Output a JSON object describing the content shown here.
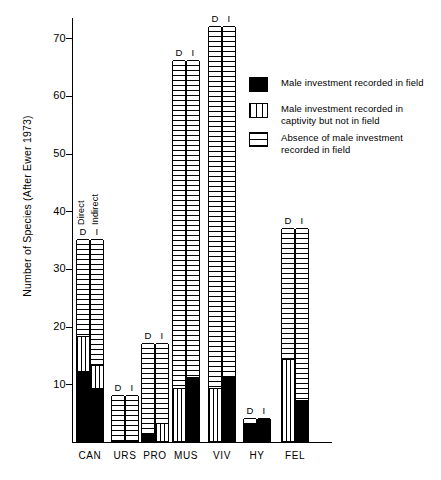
{
  "chart_data": {
    "type": "bar",
    "title": "",
    "xlabel": "",
    "ylabel": "Number of Species (After Ewer 1973)",
    "ylim": [
      0,
      73
    ],
    "grid": false,
    "legend_position": "upper right",
    "ytick_labels": [
      "70",
      "60",
      "50",
      "40",
      "30",
      "20",
      "10"
    ],
    "ytick_values": [
      70,
      60,
      50,
      40,
      30,
      20,
      10
    ],
    "categories": [
      "CAN",
      "URS",
      "PRO",
      "MUS",
      "VIV",
      "HY",
      "FEL"
    ],
    "subgroup_labels": [
      "D",
      "I"
    ],
    "subgroup_names": [
      "Direct",
      "Indirect"
    ],
    "stack_series": [
      {
        "name": "Male investment recorded in field",
        "pattern": "solid-black"
      },
      {
        "name": "Male investment recorded in captivity but not in field",
        "pattern": "vertical-stripes"
      },
      {
        "name": "Absence of male investment recorded in field",
        "pattern": "horizontal-stripes"
      }
    ],
    "bars": [
      {
        "category": "CAN",
        "sub": "D",
        "total": 35,
        "segments": [
          {
            "series": "Male investment recorded in field",
            "from": 0,
            "to": 12
          },
          {
            "series": "Male investment recorded in captivity but not in field",
            "from": 12,
            "to": 18
          },
          {
            "series": "Absence of male investment recorded in field",
            "from": 18,
            "to": 35
          }
        ]
      },
      {
        "category": "CAN",
        "sub": "I",
        "total": 35,
        "segments": [
          {
            "series": "Male investment recorded in field",
            "from": 0,
            "to": 9
          },
          {
            "series": "Male investment recorded in captivity but not in field",
            "from": 9,
            "to": 13
          },
          {
            "series": "Absence of male investment recorded in field",
            "from": 13,
            "to": 35
          }
        ]
      },
      {
        "category": "URS",
        "sub": "D",
        "total": 8,
        "segments": [
          {
            "series": "Absence of male investment recorded in field",
            "from": 0,
            "to": 8
          }
        ]
      },
      {
        "category": "URS",
        "sub": "I",
        "total": 8,
        "segments": [
          {
            "series": "Absence of male investment recorded in field",
            "from": 0,
            "to": 8
          }
        ]
      },
      {
        "category": "PRO",
        "sub": "D",
        "total": 17,
        "segments": [
          {
            "series": "Male investment recorded in field",
            "from": 0,
            "to": 1
          },
          {
            "series": "Absence of male investment recorded in field",
            "from": 1,
            "to": 17
          }
        ]
      },
      {
        "category": "PRO",
        "sub": "I",
        "total": 17,
        "segments": [
          {
            "series": "Male investment recorded in captivity but not in field",
            "from": 0,
            "to": 3
          },
          {
            "series": "Absence of male investment recorded in field",
            "from": 3,
            "to": 17
          }
        ]
      },
      {
        "category": "MUS",
        "sub": "D",
        "total": 66,
        "segments": [
          {
            "series": "Male investment recorded in captivity but not in field",
            "from": 0,
            "to": 9
          },
          {
            "series": "Absence of male investment recorded in field",
            "from": 9,
            "to": 66
          }
        ]
      },
      {
        "category": "MUS",
        "sub": "I",
        "total": 66,
        "segments": [
          {
            "series": "Male investment recorded in field",
            "from": 0,
            "to": 11
          },
          {
            "series": "Absence of male investment recorded in field",
            "from": 11,
            "to": 66
          }
        ]
      },
      {
        "category": "VIV",
        "sub": "D",
        "total": 72,
        "segments": [
          {
            "series": "Male investment recorded in captivity but not in field",
            "from": 0,
            "to": 9
          },
          {
            "series": "Absence of male investment recorded in field",
            "from": 9,
            "to": 72
          }
        ]
      },
      {
        "category": "VIV",
        "sub": "I",
        "total": 72,
        "segments": [
          {
            "series": "Male investment recorded in field",
            "from": 0,
            "to": 11
          },
          {
            "series": "Absence of male investment recorded in field",
            "from": 11,
            "to": 72
          }
        ]
      },
      {
        "category": "HY",
        "sub": "D",
        "total": 4,
        "segments": [
          {
            "series": "Male investment recorded in field",
            "from": 0,
            "to": 3
          },
          {
            "series": "Absence of male investment recorded in field",
            "from": 3,
            "to": 4
          }
        ]
      },
      {
        "category": "HY",
        "sub": "I",
        "total": 4,
        "segments": [
          {
            "series": "Male investment recorded in field",
            "from": 0,
            "to": 4
          }
        ]
      },
      {
        "category": "FEL",
        "sub": "D",
        "total": 37,
        "segments": [
          {
            "series": "Male investment recorded in captivity but not in field",
            "from": 0,
            "to": 14
          },
          {
            "series": "Absence of male investment recorded in field",
            "from": 14,
            "to": 37
          }
        ]
      },
      {
        "category": "FEL",
        "sub": "I",
        "total": 37,
        "segments": [
          {
            "series": "Male investment recorded in field",
            "from": 0,
            "to": 7
          },
          {
            "series": "Absence of male investment recorded in field",
            "from": 7,
            "to": 37
          }
        ]
      }
    ]
  },
  "annotations": {
    "direct": "Direct",
    "indirect": "Indirect"
  },
  "legend": {
    "items": [
      {
        "label": "Male investment recorded in field",
        "pattern": "solid-black"
      },
      {
        "label": "Male investment recorded in captivity but not in field",
        "pattern": "vertical-stripes"
      },
      {
        "label": "Absence of male investment recorded in field",
        "pattern": "horizontal-stripes"
      }
    ]
  }
}
